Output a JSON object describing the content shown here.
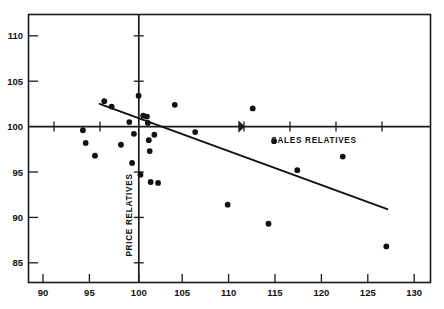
{
  "chart_data": {
    "type": "scatter",
    "title": "",
    "xlabel": "SALES RELATIVES",
    "ylabel": "PRICE RELATIVES",
    "xlim": [
      88.4,
      132.0
    ],
    "ylim": [
      83.6,
      111.8
    ],
    "xticks": [
      90,
      95,
      100,
      105,
      110,
      115,
      120,
      125,
      130
    ],
    "yticks": [
      85,
      90,
      95,
      100,
      105,
      110
    ],
    "grid": false,
    "legend": null,
    "reference_lines": [
      {
        "orientation": "horizontal",
        "value": 100
      },
      {
        "orientation": "vertical",
        "value": 100
      }
    ],
    "points": [
      {
        "x": 94.3,
        "y": 99.6
      },
      {
        "x": 94.6,
        "y": 98.2
      },
      {
        "x": 95.6,
        "y": 96.8
      },
      {
        "x": 96.6,
        "y": 102.8
      },
      {
        "x": 97.4,
        "y": 102.2
      },
      {
        "x": 98.4,
        "y": 98.0
      },
      {
        "x": 99.3,
        "y": 100.5
      },
      {
        "x": 99.6,
        "y": 96.0
      },
      {
        "x": 99.8,
        "y": 99.2
      },
      {
        "x": 100.3,
        "y": 103.4
      },
      {
        "x": 100.5,
        "y": 94.7
      },
      {
        "x": 100.8,
        "y": 101.2
      },
      {
        "x": 101.2,
        "y": 101.1
      },
      {
        "x": 101.3,
        "y": 100.4
      },
      {
        "x": 101.4,
        "y": 98.5
      },
      {
        "x": 101.5,
        "y": 97.3
      },
      {
        "x": 101.6,
        "y": 93.9
      },
      {
        "x": 102.0,
        "y": 99.1
      },
      {
        "x": 102.4,
        "y": 93.8
      },
      {
        "x": 104.2,
        "y": 102.4
      },
      {
        "x": 106.4,
        "y": 99.4
      },
      {
        "x": 109.9,
        "y": 91.4
      },
      {
        "x": 112.6,
        "y": 102.0
      },
      {
        "x": 114.3,
        "y": 89.3
      },
      {
        "x": 114.9,
        "y": 98.4
      },
      {
        "x": 117.4,
        "y": 95.2
      },
      {
        "x": 122.3,
        "y": 96.7
      },
      {
        "x": 127.0,
        "y": 86.8
      }
    ],
    "fit_line": {
      "type": "linear",
      "x_start": 96.1,
      "y_start": 102.5,
      "x_end": 127.1,
      "y_end": 90.9
    },
    "tick_labels": {
      "x": [
        "90",
        "95",
        "100",
        "105",
        "110",
        "115",
        "120",
        "125",
        "130"
      ],
      "y": [
        "110",
        "105",
        "100",
        "95",
        "90",
        "85"
      ]
    }
  }
}
